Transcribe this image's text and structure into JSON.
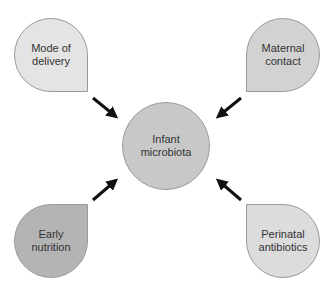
{
  "diagram": {
    "center": {
      "label": "Infant\nmicrobiota",
      "color": "#c8c8c8"
    },
    "nodes": [
      {
        "id": "mode-of-delivery",
        "label": "Mode of\ndelivery",
        "position": "top-left",
        "color": "#e4e4e4"
      },
      {
        "id": "maternal-contact",
        "label": "Maternal\ncontact",
        "position": "top-right",
        "color": "#d2d2d2"
      },
      {
        "id": "early-nutrition",
        "label": "Early\nnutrition",
        "position": "bottom-left",
        "color": "#b4b4b4"
      },
      {
        "id": "perinatal-antibiotics",
        "label": "Perinatal\nantibiotics",
        "position": "bottom-right",
        "color": "#dcdcdc"
      }
    ],
    "edges": [
      {
        "from": "mode-of-delivery",
        "to": "infant-microbiota"
      },
      {
        "from": "maternal-contact",
        "to": "infant-microbiota"
      },
      {
        "from": "early-nutrition",
        "to": "infant-microbiota"
      },
      {
        "from": "perinatal-antibiotics",
        "to": "infant-microbiota"
      }
    ]
  }
}
